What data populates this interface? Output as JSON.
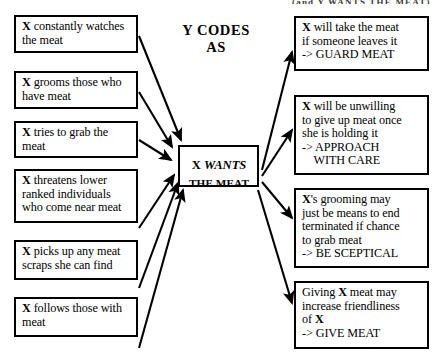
{
  "diagram": {
    "title_fragment": "(and Y WANTS THE MEAT)",
    "heading": {
      "line1": "Y CODES",
      "line2": "AS"
    },
    "center_node": {
      "name_prefix": "X",
      "verb": "WANTS",
      "object": "THE MEAT"
    },
    "evidence_nodes": [
      {
        "id": "watches",
        "lines": [
          {
            "bold": "X",
            "rest": " constantly watches"
          },
          {
            "bold": "",
            "rest": "the meat"
          }
        ]
      },
      {
        "id": "grooms",
        "lines": [
          {
            "bold": "X",
            "rest": " grooms those who"
          },
          {
            "bold": "",
            "rest": "have meat"
          }
        ]
      },
      {
        "id": "grab",
        "lines": [
          {
            "bold": "X",
            "rest": " tries to grab the"
          },
          {
            "bold": "",
            "rest": "meat"
          }
        ]
      },
      {
        "id": "threatens",
        "lines": [
          {
            "bold": "X",
            "rest": " threatens lower"
          },
          {
            "bold": "",
            "rest": "ranked individuals"
          },
          {
            "bold": "",
            "rest": "who come near meat"
          }
        ]
      },
      {
        "id": "scraps",
        "lines": [
          {
            "bold": "X",
            "rest": " picks up any meat"
          },
          {
            "bold": "",
            "rest": "scraps she can find"
          }
        ]
      },
      {
        "id": "follows",
        "lines": [
          {
            "bold": "X",
            "rest": " follows those with"
          },
          {
            "bold": "",
            "rest": "meat"
          }
        ]
      }
    ],
    "prediction_nodes": [
      {
        "id": "guard-meat",
        "lines": [
          {
            "bold": "X",
            "rest": " will take the meat"
          },
          {
            "bold": "",
            "rest": "if someone leaves it"
          },
          {
            "bold": "",
            "rest": "-> GUARD MEAT"
          }
        ]
      },
      {
        "id": "approach-with-care",
        "lines": [
          {
            "bold": "X",
            "rest": " will be unwilling"
          },
          {
            "bold": "",
            "rest": "to give up meat once"
          },
          {
            "bold": "",
            "rest": "she is holding it"
          },
          {
            "bold": "",
            "rest": "-> APPROACH"
          },
          {
            "bold": "",
            "rest": "     WITH CARE"
          }
        ]
      },
      {
        "id": "be-sceptical",
        "lines": [
          {
            "bold": "X",
            "rest": "'s grooming may"
          },
          {
            "bold": "",
            "rest": "just be means to end"
          },
          {
            "bold": "",
            "rest": "terminated if chance"
          },
          {
            "bold": "",
            "rest": "to grab meat"
          },
          {
            "bold": "",
            "rest": "-> BE SCEPTICAL"
          }
        ]
      },
      {
        "id": "give-meat",
        "lines": [
          {
            "bold": "",
            "rest": "Giving "
          },
          {
            "bold": "",
            "rest": "increase friendliness"
          },
          {
            "bold": "",
            "rest": "of "
          },
          {
            "bold": "",
            "rest": "-> GIVE MEAT"
          }
        ],
        "flat_lines": [
          "Giving X meat may",
          "increase friendliness",
          "of X",
          "-> GIVE MEAT"
        ]
      }
    ],
    "colors": {
      "stroke": "#000000",
      "background": "#ffffff",
      "text": "#000000"
    }
  }
}
